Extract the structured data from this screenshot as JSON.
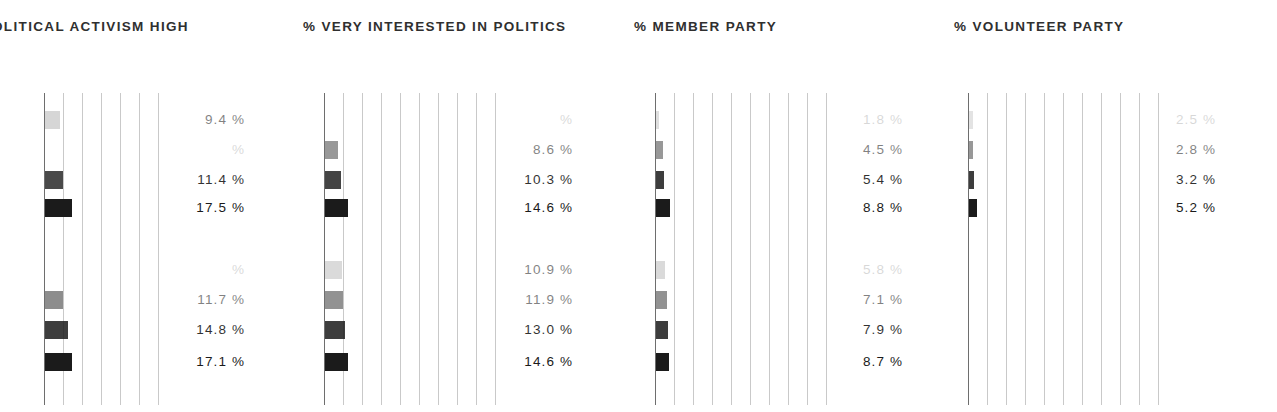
{
  "figure": {
    "width": 1277,
    "height": 412,
    "background": "#ffffff",
    "bar_color": "#1b1b1b",
    "gridline_color": "#c9c9c9",
    "axis_color": "#6e6e6e",
    "text_color": "#2f2f2f",
    "note_cropped_left": "first panel title and bars are clipped by the left edge of the screenshot",
    "percent_suffix": "%"
  },
  "chart_data": {
    "type": "bar",
    "orientation": "horizontal",
    "title": "",
    "xlabel": "",
    "ylabel": "",
    "grid": true,
    "legend": "none",
    "xlim": [
      0,
      22
    ],
    "gridline_spacing_percent": 2,
    "bar_opacity_by_row": [
      0.18,
      0.45,
      0.78,
      1.0
    ],
    "panels": [
      {
        "id": "political-activism-high",
        "title": "OLITICAL ACTIVISM HIGH",
        "title_full": "% POLITICAL ACTIVISM HIGH",
        "clipped": true,
        "groups": [
          {
            "id": "group-upper",
            "bars": [
              {
                "value": 9.4,
                "label": "9.4 %",
                "faded": true,
                "opacity": 0.18
              },
              {
                "value": null,
                "label": "%",
                "faded": true,
                "opacity": 0.3,
                "unreadable": true
              },
              {
                "value": 11.4,
                "label": "11.4 %",
                "faded": false,
                "opacity": 0.8
              },
              {
                "value": 17.5,
                "label": "17.5 %",
                "faded": false,
                "opacity": 1.0
              }
            ]
          },
          {
            "id": "group-lower",
            "bars": [
              {
                "value": null,
                "label": "%",
                "faded": true,
                "opacity": 0.18,
                "unreadable": true
              },
              {
                "value": 11.7,
                "label": "11.7 %",
                "faded": true,
                "opacity": 0.5
              },
              {
                "value": 14.8,
                "label": "14.8 %",
                "faded": false,
                "opacity": 0.85
              },
              {
                "value": 17.1,
                "label": "17.1 %",
                "faded": false,
                "opacity": 1.0
              }
            ]
          }
        ]
      },
      {
        "id": "very-interested-in-politics",
        "title": "% VERY INTERESTED IN POLITICS",
        "clipped": false,
        "groups": [
          {
            "id": "group-upper",
            "bars": [
              {
                "value": null,
                "label": "%",
                "faded": true,
                "opacity": 0.14,
                "unreadable": true
              },
              {
                "value": 8.6,
                "label": "8.6 %",
                "faded": true,
                "opacity": 0.45
              },
              {
                "value": 10.3,
                "label": "10.3 %",
                "faded": false,
                "opacity": 0.82
              },
              {
                "value": 14.6,
                "label": "14.6 %",
                "faded": false,
                "opacity": 1.0
              }
            ]
          },
          {
            "id": "group-lower",
            "bars": [
              {
                "value": 10.9,
                "label": "10.9 %",
                "faded": true,
                "opacity": 0.16
              },
              {
                "value": 11.9,
                "label": "11.9 %",
                "faded": true,
                "opacity": 0.48
              },
              {
                "value": 13.0,
                "label": "13.0 %",
                "faded": false,
                "opacity": 0.85
              },
              {
                "value": 14.6,
                "label": "14.6 %",
                "faded": false,
                "opacity": 1.0
              }
            ]
          }
        ]
      },
      {
        "id": "member-party",
        "title": "% MEMBER PARTY",
        "clipped": false,
        "groups": [
          {
            "id": "group-upper",
            "bars": [
              {
                "value": 1.8,
                "label": "1.8 %",
                "faded": true,
                "opacity": 0.14,
                "unreadable": true
              },
              {
                "value": 4.5,
                "label": "4.5 %",
                "faded": true,
                "opacity": 0.45
              },
              {
                "value": 5.4,
                "label": "5.4 %",
                "faded": false,
                "opacity": 0.85
              },
              {
                "value": 8.8,
                "label": "8.8 %",
                "faded": false,
                "opacity": 1.0
              }
            ]
          },
          {
            "id": "group-lower",
            "bars": [
              {
                "value": 5.8,
                "label": "5.8 %",
                "faded": true,
                "opacity": 0.16,
                "unreadable": true
              },
              {
                "value": 7.1,
                "label": "7.1 %",
                "faded": true,
                "opacity": 0.48
              },
              {
                "value": 7.9,
                "label": "7.9 %",
                "faded": false,
                "opacity": 0.85
              },
              {
                "value": 8.7,
                "label": "8.7 %",
                "faded": false,
                "opacity": 1.0
              }
            ]
          }
        ]
      },
      {
        "id": "volunteer-party",
        "title": "% VOLUNTEER PARTY",
        "clipped": false,
        "groups": [
          {
            "id": "group-upper",
            "bars": [
              {
                "value": 2.5,
                "label": "2.5 %",
                "faded": true,
                "opacity": 0.12,
                "unreadable": true
              },
              {
                "value": 2.8,
                "label": "2.8 %",
                "faded": true,
                "opacity": 0.45
              },
              {
                "value": 3.2,
                "label": "3.2 %",
                "faded": false,
                "opacity": 0.85
              },
              {
                "value": 5.2,
                "label": "5.2 %",
                "faded": false,
                "opacity": 1.0
              }
            ]
          },
          {
            "id": "group-lower",
            "empty": true,
            "bars": []
          }
        ]
      }
    ]
  },
  "layout": {
    "row_y": [
      18,
      48,
      78,
      106,
      168,
      198,
      228,
      260
    ],
    "bar_height": 18,
    "panel_geometry": [
      {
        "title_left": -8,
        "plot_left": -8,
        "plot_width": 180,
        "axis_x": 52,
        "grid_count": 9,
        "grid_step": 19,
        "px_per_percent": 1.55,
        "labels_left": 155
      },
      {
        "title_left": 303,
        "plot_left": 322,
        "plot_width": 190,
        "axis_x": 2,
        "grid_count": 10,
        "grid_step": 19,
        "px_per_percent": 1.55,
        "labels_left": 483
      },
      {
        "title_left": 634,
        "plot_left": 653,
        "plot_width": 190,
        "axis_x": 2,
        "grid_count": 10,
        "grid_step": 19,
        "px_per_percent": 1.55,
        "labels_left": 813
      },
      {
        "title_left": 954,
        "plot_left": 966,
        "plot_width": 200,
        "axis_x": 2,
        "grid_count": 11,
        "grid_step": 19,
        "px_per_percent": 1.55,
        "labels_left": 1126
      }
    ]
  }
}
